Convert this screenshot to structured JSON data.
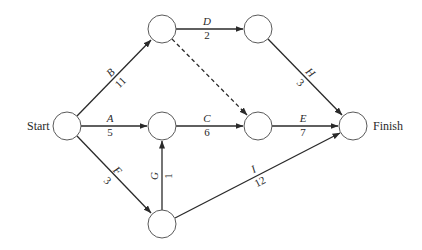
{
  "diagram": {
    "type": "activity-on-arrow project network",
    "nodes": [
      {
        "id": "start",
        "label": "Start"
      },
      {
        "id": "n_top_left",
        "label": ""
      },
      {
        "id": "n_top_right",
        "label": ""
      },
      {
        "id": "n_mid_center",
        "label": ""
      },
      {
        "id": "n_mid_right",
        "label": ""
      },
      {
        "id": "n_bottom",
        "label": ""
      },
      {
        "id": "finish",
        "label": "Finish"
      }
    ],
    "edges": [
      {
        "activity": "A",
        "duration": "5",
        "from": "start",
        "to": "n_mid_center"
      },
      {
        "activity": "B",
        "duration": "11",
        "from": "start",
        "to": "n_top_left"
      },
      {
        "activity": "C",
        "duration": "6",
        "from": "n_mid_center",
        "to": "n_mid_right"
      },
      {
        "activity": "D",
        "duration": "2",
        "from": "n_top_left",
        "to": "n_top_right"
      },
      {
        "activity": "E",
        "duration": "7",
        "from": "n_mid_right",
        "to": "finish"
      },
      {
        "activity": "F",
        "duration": "3",
        "from": "start",
        "to": "n_bottom"
      },
      {
        "activity": "G",
        "duration": "1",
        "from": "n_bottom",
        "to": "n_mid_center"
      },
      {
        "activity": "H",
        "duration": "3",
        "from": "n_top_right",
        "to": "finish"
      },
      {
        "activity": "I",
        "duration": "12",
        "from": "n_bottom",
        "to": "finish"
      },
      {
        "activity": "",
        "duration": "",
        "from": "n_top_left",
        "to": "n_mid_right",
        "dummy": true
      }
    ],
    "labels": {
      "start": "Start",
      "finish": "Finish",
      "A": "A",
      "A_dur": "5",
      "B": "B",
      "B_dur": "11",
      "C": "C",
      "C_dur": "6",
      "D": "D",
      "D_dur": "2",
      "E": "E",
      "E_dur": "7",
      "F": "F",
      "F_dur": "3",
      "G": "G",
      "G_dur": "1",
      "H": "H",
      "H_dur": "3",
      "I": "I",
      "I_dur": "12"
    }
  }
}
